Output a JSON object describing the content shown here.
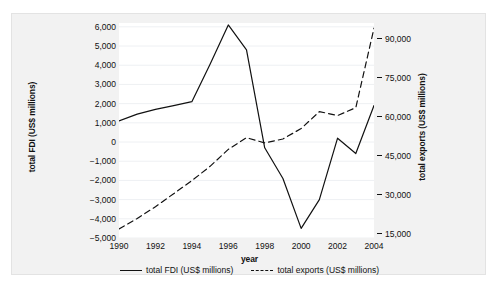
{
  "chart_data": {
    "type": "line",
    "title": "",
    "xlabel": "year",
    "ylabel": "total FDI (US$ millions)",
    "ylabel_right": "total exports (US$ millions)",
    "x": [
      1990,
      1991,
      1992,
      1993,
      1994,
      1995,
      1996,
      1997,
      1998,
      1999,
      2000,
      2001,
      2002,
      2003,
      2004
    ],
    "xticks": [
      "1990",
      "1992",
      "1994",
      "1996",
      "1998",
      "2000",
      "2002",
      "2004"
    ],
    "xtick_values": [
      1990,
      1992,
      1994,
      1996,
      1998,
      2000,
      2002,
      2004
    ],
    "xlim": [
      1990,
      2004
    ],
    "ylim": [
      -5000,
      6200
    ],
    "ylim_right": [
      13500,
      96000
    ],
    "yticks": [
      "6,000",
      "5,000",
      "4,000",
      "3,000",
      "2,000",
      "1,000",
      "0",
      "−1,000",
      "−2,000",
      "−3,000",
      "−4,000",
      "−5,000"
    ],
    "ytick_values": [
      6000,
      5000,
      4000,
      3000,
      2000,
      1000,
      0,
      -1000,
      -2000,
      -3000,
      -4000,
      -5000
    ],
    "yticks_right": [
      "90,000",
      "75,000",
      "60,000",
      "45,000",
      "30,000",
      "15,000"
    ],
    "ytick_values_right": [
      90000,
      75000,
      60000,
      45000,
      30000,
      15000
    ],
    "grid": true,
    "legend_position": "below",
    "series": [
      {
        "name": "total FDI (US$ millions)",
        "axis": "left",
        "style": "solid",
        "color": "#111111",
        "values": [
          1100,
          1450,
          1700,
          1900,
          2100,
          4050,
          6100,
          4800,
          -300,
          -1900,
          -4500,
          -3000,
          200,
          -600,
          1900
        ]
      },
      {
        "name": "total exports (US$ millions)",
        "axis": "right",
        "style": "dashed",
        "color": "#111111",
        "values": [
          17000,
          21000,
          25500,
          30500,
          35500,
          41000,
          47500,
          52000,
          50000,
          51500,
          55500,
          62000,
          60500,
          63500,
          94000
        ]
      }
    ]
  },
  "legend": {
    "items": [
      {
        "label": "total FDI (US$ millions)",
        "style": "solid"
      },
      {
        "label": "total exports (US$ millions)",
        "style": "dashed"
      }
    ]
  }
}
